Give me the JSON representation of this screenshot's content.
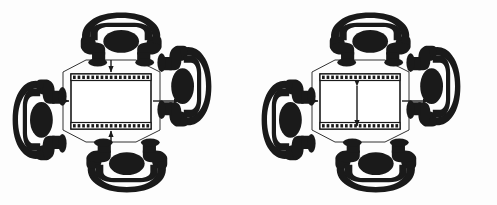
{
  "figure": {
    "title": "Two circular seating arrangement diagrams around a central film-strip frame",
    "panel_count": 2,
    "background_color": "#fdfdfd",
    "ink_color": "#1a1a1a",
    "line_color": "#333333",
    "frame_fill": "#ffffff",
    "canvas": {
      "width": 497,
      "height": 205
    }
  },
  "panels": [
    {
      "id": "panel-left",
      "label": "Left diagram",
      "center": {
        "name": "film-frame",
        "label": "Central film strip frame",
        "style": "rectangle with perforated top and bottom bands",
        "perforation_count": 17,
        "interior_annotation": "none"
      },
      "figures": [
        {
          "position": "top",
          "name": "seated-figure-top",
          "label": "Seated figure (top)",
          "rotation": 0
        },
        {
          "position": "right",
          "name": "seated-figure-right",
          "label": "Seated figure (right)",
          "rotation": 270
        },
        {
          "position": "bottom",
          "name": "seated-figure-bottom",
          "label": "Seated figure (bottom)",
          "rotation": 180
        },
        {
          "position": "left",
          "name": "seated-figure-left",
          "label": "Seated figure (left)",
          "rotation": 90
        }
      ],
      "arrows": [
        {
          "name": "arrow-down-top",
          "label": "Arrow pointing down into frame",
          "direction": "down",
          "heads": 1
        },
        {
          "name": "arrow-up-bottom",
          "label": "Arrow pointing up into frame",
          "direction": "up",
          "heads": 1
        },
        {
          "name": "arrow-right-in",
          "label": "Short arrow entering frame at left",
          "direction": "right",
          "heads": 1
        },
        {
          "name": "arrow-right-out",
          "label": "Long arrow leaving frame at right",
          "direction": "right",
          "heads": 1
        }
      ],
      "links": [
        {
          "name": "link-top-left",
          "label": "Connector top to left"
        },
        {
          "name": "link-top-right",
          "label": "Connector top to right"
        },
        {
          "name": "link-bottom-left",
          "label": "Connector bottom to left"
        },
        {
          "name": "link-bottom-right",
          "label": "Connector bottom to right"
        }
      ]
    },
    {
      "id": "panel-right",
      "label": "Right diagram",
      "center": {
        "name": "film-frame",
        "label": "Central film strip frame",
        "style": "rectangle with perforated top and bottom bands",
        "perforation_count": 17,
        "interior_annotation": "vertical double-headed arrow"
      },
      "figures": [
        {
          "position": "top",
          "name": "seated-figure-top",
          "label": "Seated figure (top)",
          "rotation": 0
        },
        {
          "position": "right",
          "name": "seated-figure-right",
          "label": "Seated figure (right)",
          "rotation": 270
        },
        {
          "position": "bottom",
          "name": "seated-figure-bottom",
          "label": "Seated figure (bottom)",
          "rotation": 180
        },
        {
          "position": "left",
          "name": "seated-figure-left",
          "label": "Seated figure (left)",
          "rotation": 90
        }
      ],
      "arrows": [
        {
          "name": "arrow-vertical-double",
          "label": "Vertical double-headed arrow inside frame",
          "direction": "vertical",
          "heads": 2
        },
        {
          "name": "arrow-right-in",
          "label": "Short arrow entering frame at left",
          "direction": "right",
          "heads": 1
        },
        {
          "name": "arrow-right-out",
          "label": "Long arrow leaving frame at right",
          "direction": "right",
          "heads": 1
        }
      ],
      "links": [
        {
          "name": "link-top-left",
          "label": "Connector top to left"
        },
        {
          "name": "link-top-right",
          "label": "Connector top to right"
        },
        {
          "name": "link-bottom-left",
          "label": "Connector bottom to left"
        },
        {
          "name": "link-bottom-right",
          "label": "Connector bottom to right"
        }
      ]
    }
  ]
}
